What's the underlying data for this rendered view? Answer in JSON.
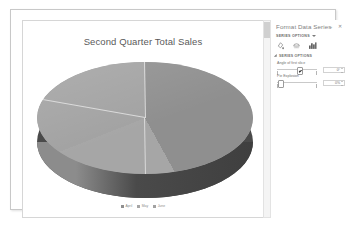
{
  "window": {
    "background_color": "#ffffff",
    "frame_border_color": "#c8c8c8"
  },
  "chart": {
    "title": "Second Quarter Total Sales",
    "border_color": "#d6d6d6"
  },
  "chart_data": {
    "type": "pie",
    "title": "Second Quarter Total Sales",
    "three_d": true,
    "categories": [
      "April",
      "May",
      "June"
    ],
    "values": [
      42,
      27,
      31
    ],
    "colors": [
      "#8f8f8f",
      "#a6a6a6",
      "#a2a2a2"
    ],
    "side_wall_color": "#4a4a4a",
    "slice_border_color": "#d9d9d9",
    "legend": {
      "position": "bottom",
      "entries": [
        "April",
        "May",
        "June"
      ]
    },
    "xlabel": "",
    "ylabel": "",
    "grid": false,
    "data_labels": false
  },
  "legend": {
    "items": [
      {
        "label": "April",
        "color": "#8f8f8f"
      },
      {
        "label": "May",
        "color": "#a6a6a6"
      },
      {
        "label": "June",
        "color": "#a2a2a2"
      }
    ]
  },
  "scrollbar": {
    "track_color": "#f4f4f4",
    "thumb_color": "#d0d0d0"
  },
  "pane": {
    "title": "Format Data Series",
    "collapse_label": "⌄",
    "close_label": "✕",
    "subtitle": "SERIES OPTIONS",
    "icons": [
      {
        "name": "fill-and-line-icon",
        "tooltip": "Fill & Line"
      },
      {
        "name": "effects-icon",
        "tooltip": "Effects"
      },
      {
        "name": "series-options-icon",
        "tooltip": "Series Options"
      }
    ],
    "section": {
      "header": "SERIES OPTIONS",
      "fields": [
        {
          "label": "Angle of first slice",
          "value": "0°",
          "slider_percent": 52
        },
        {
          "label": "Pie Explosion",
          "value": "0%",
          "slider_percent": 3
        }
      ]
    }
  }
}
